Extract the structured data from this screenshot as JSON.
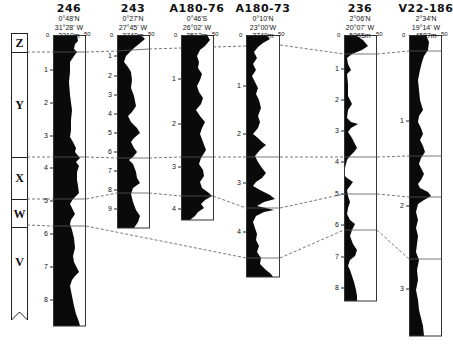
{
  "figure": {
    "type": "core correlation diagram",
    "scale_label_min": "0",
    "scale_label_max": "50",
    "colors": {
      "fill": "#0a0a0a",
      "line": "#333333",
      "dash": "#555555",
      "background": "#ffffff"
    }
  },
  "zones": [
    {
      "label": "Z"
    },
    {
      "label": "Y"
    },
    {
      "label": "X"
    },
    {
      "label": "W"
    },
    {
      "label": "V"
    }
  ],
  "cores": [
    {
      "id": "246",
      "lat": "0°48'N",
      "lon": "31°28' W",
      "depth": "3210m",
      "ticks": [
        "1",
        "2",
        "3",
        "4",
        "5",
        "6",
        "7",
        "8"
      ]
    },
    {
      "id": "243",
      "lat": "0°27'N",
      "lon": "27°45' W",
      "depth": "3740m",
      "ticks": [
        "1",
        "2",
        "3",
        "4",
        "5",
        "6",
        "7",
        "8",
        "9"
      ]
    },
    {
      "id": "A180-76",
      "lat": "0°46'S",
      "lon": "26°02' W",
      "depth": "3512m",
      "ticks": [
        "1",
        "2",
        "3",
        "4"
      ]
    },
    {
      "id": "A180-73",
      "lat": "0°10'N",
      "lon": "23°00'W",
      "depth": "3749m",
      "ticks": [
        "1",
        "2",
        "3",
        "4"
      ]
    },
    {
      "id": "236",
      "lat": "2°06'N",
      "lon": "20°07' W",
      "depth": "5065m",
      "ticks": [
        "1",
        "2",
        "3",
        "4",
        "5",
        "6",
        "7",
        "8"
      ]
    },
    {
      "id": "V22-186",
      "lat": "2°34'N",
      "lon": "19°14' W",
      "depth": "4587m",
      "ticks": [
        "1",
        "2",
        "3"
      ]
    }
  ]
}
